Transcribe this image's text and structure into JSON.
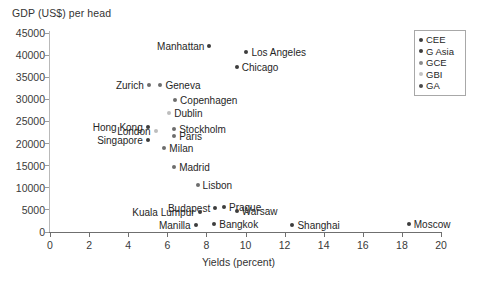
{
  "chart_data": {
    "type": "scatter",
    "title": "",
    "ylabel": "GDP (US$) per head",
    "xlabel": "Yields (percent)",
    "xlim": [
      0,
      20
    ],
    "ylim": [
      0,
      45000
    ],
    "xticks": [
      0,
      2,
      4,
      6,
      8,
      10,
      12,
      14,
      16,
      18,
      20
    ],
    "yticks": [
      0,
      5000,
      10000,
      15000,
      20000,
      25000,
      30000,
      35000,
      40000,
      45000
    ],
    "grid": false,
    "legend_position": "top-right",
    "legend": [
      {
        "label": "CEE",
        "color": "#3d3d3d"
      },
      {
        "label": "G Asia",
        "color": "#3d3d3d"
      },
      {
        "label": "GCE",
        "color": "#8a8a8a"
      },
      {
        "label": "GBI",
        "color": "#c2c2c2"
      },
      {
        "label": "GA",
        "color": "#4a4a4a"
      }
    ],
    "points": [
      {
        "name": "Manhattan",
        "x": 8.15,
        "y": 42100,
        "series": "GA",
        "color": "#3d3d3d",
        "label_side": "left"
      },
      {
        "name": "Los Angeles",
        "x": 10.05,
        "y": 40700,
        "series": "GA",
        "color": "#3d3d3d",
        "label_side": "right"
      },
      {
        "name": "Chicago",
        "x": 9.55,
        "y": 37300,
        "series": "GA",
        "color": "#3d3d3d",
        "label_side": "right"
      },
      {
        "name": "Zurich",
        "x": 5.05,
        "y": 33200,
        "series": "GCE",
        "color": "#6d6d6d",
        "label_side": "left"
      },
      {
        "name": "Geneva",
        "x": 5.65,
        "y": 33200,
        "series": "GCE",
        "color": "#6d6d6d",
        "label_side": "right"
      },
      {
        "name": "Copenhagen",
        "x": 6.4,
        "y": 29900,
        "series": "GCE",
        "color": "#6d6d6d",
        "label_side": "right"
      },
      {
        "name": "Dublin",
        "x": 6.1,
        "y": 26900,
        "series": "GBI",
        "color": "#bdbdbd",
        "label_side": "right"
      },
      {
        "name": "Hong Kong",
        "x": 5.0,
        "y": 23800,
        "series": "G Asia",
        "color": "#3d3d3d",
        "label_side": "left"
      },
      {
        "name": "Stockholm",
        "x": 6.35,
        "y": 23400,
        "series": "GCE",
        "color": "#6d6d6d",
        "label_side": "right"
      },
      {
        "name": "London",
        "x": 5.4,
        "y": 22900,
        "series": "GBI",
        "color": "#bdbdbd",
        "label_side": "left"
      },
      {
        "name": "Paris",
        "x": 6.35,
        "y": 21800,
        "series": "GCE",
        "color": "#6d6d6d",
        "label_side": "right"
      },
      {
        "name": "Singapore",
        "x": 5.0,
        "y": 20900,
        "series": "G Asia",
        "color": "#3d3d3d",
        "label_side": "left"
      },
      {
        "name": "Milan",
        "x": 5.85,
        "y": 19000,
        "series": "GCE",
        "color": "#6d6d6d",
        "label_side": "right"
      },
      {
        "name": "Madrid",
        "x": 6.35,
        "y": 14700,
        "series": "GCE",
        "color": "#6d6d6d",
        "label_side": "right"
      },
      {
        "name": "Lisbon",
        "x": 7.55,
        "y": 10600,
        "series": "GCE",
        "color": "#6d6d6d",
        "label_side": "right"
      },
      {
        "name": "Budapest",
        "x": 8.45,
        "y": 5400,
        "series": "CEE",
        "color": "#3d3d3d",
        "label_side": "left"
      },
      {
        "name": "Prague",
        "x": 8.9,
        "y": 5600,
        "series": "CEE",
        "color": "#3d3d3d",
        "label_side": "right"
      },
      {
        "name": "Warsaw",
        "x": 9.55,
        "y": 4800,
        "series": "CEE",
        "color": "#3d3d3d",
        "label_side": "right"
      },
      {
        "name": "Kuala Lumpur",
        "x": 7.65,
        "y": 4500,
        "series": "G Asia",
        "color": "#3d3d3d",
        "label_side": "left"
      },
      {
        "name": "Bangkok",
        "x": 8.4,
        "y": 1900,
        "series": "G Asia",
        "color": "#3d3d3d",
        "label_side": "right"
      },
      {
        "name": "Manilla",
        "x": 7.45,
        "y": 1500,
        "series": "G Asia",
        "color": "#3d3d3d",
        "label_side": "left"
      },
      {
        "name": "Shanghai",
        "x": 12.4,
        "y": 1500,
        "series": "G Asia",
        "color": "#3d3d3d",
        "label_side": "right"
      },
      {
        "name": "Moscow",
        "x": 18.35,
        "y": 1700,
        "series": "CEE",
        "color": "#3d3d3d",
        "label_side": "right"
      }
    ]
  }
}
